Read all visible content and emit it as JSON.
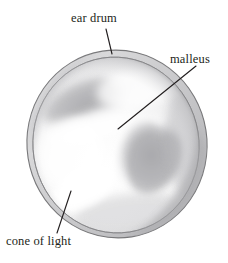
{
  "figure": {
    "type": "anatomical-illustration",
    "medium": "pencil drawing",
    "background_color": "#ffffff",
    "ink_color": "#231f20",
    "membrane": {
      "outline_color": "#6f6f70",
      "rim_fill": "#d9d9da",
      "interior_fill": "#fbfbfb",
      "shadow_color": "#b9b9bb",
      "bounds": {
        "left": 27,
        "top": 50,
        "right": 207,
        "bottom": 238
      }
    },
    "labels": [
      {
        "id": "ear-drum",
        "text": "ear drum",
        "x": 71,
        "y": 11,
        "leader": {
          "x1": 106,
          "y1": 29,
          "x2": 112,
          "y2": 54
        }
      },
      {
        "id": "malleus",
        "text": "malleus",
        "x": 170,
        "y": 52,
        "leader": {
          "x1": 196,
          "y1": 66,
          "x2": 118,
          "y2": 129
        }
      },
      {
        "id": "cone-of-light",
        "text": "cone of light",
        "x": 6,
        "y": 234,
        "leader": {
          "x1": 71,
          "y1": 191,
          "x2": 57,
          "y2": 233
        }
      }
    ]
  }
}
